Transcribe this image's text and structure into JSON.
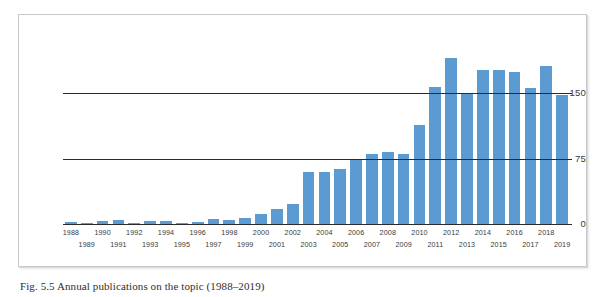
{
  "figure": {
    "caption": "Fig. 5.5  Annual publications on the topic (1988–2019)"
  },
  "chart_data": {
    "type": "bar",
    "title": "",
    "subtitle": "",
    "xlabel": "",
    "ylabel": "",
    "grid": true,
    "legend": null,
    "ylim": [
      0,
      200
    ],
    "yticks": [
      0,
      75,
      150
    ],
    "ytick_labels": [
      "0",
      "75",
      "150"
    ],
    "bar_color": "#5b9bd1",
    "axis_color": "#2b2b2b",
    "categories": [
      "1988",
      "1989",
      "1990",
      "1991",
      "1992",
      "1993",
      "1994",
      "1995",
      "1996",
      "1997",
      "1998",
      "1999",
      "2000",
      "2001",
      "2002",
      "2003",
      "2004",
      "2005",
      "2006",
      "2007",
      "2008",
      "2009",
      "2010",
      "2011",
      "2012",
      "2013",
      "2014",
      "2015",
      "2016",
      "2017",
      "2018",
      "2019"
    ],
    "values": [
      2,
      1,
      3,
      5,
      1,
      4,
      3,
      1,
      2,
      6,
      5,
      7,
      12,
      17,
      23,
      60,
      60,
      63,
      75,
      80,
      83,
      80,
      113,
      157,
      190,
      149,
      176,
      176,
      174,
      156,
      181,
      148
    ],
    "tick_row_top": [
      "1988",
      "1990",
      "1992",
      "1994",
      "1996",
      "1998",
      "2000",
      "2002",
      "2004",
      "2006",
      "2008",
      "2010",
      "2012",
      "2014",
      "2016",
      "2018"
    ],
    "tick_row_bottom": [
      "1989",
      "1991",
      "1993",
      "1995",
      "1997",
      "1999",
      "2001",
      "2003",
      "2005",
      "2007",
      "2009",
      "2011",
      "2013",
      "2015",
      "2017",
      "2019"
    ]
  }
}
